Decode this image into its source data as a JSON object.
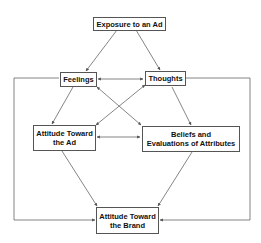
{
  "diagram": {
    "nodes": {
      "exposure": {
        "label": "Exposure to an Ad"
      },
      "feelings": {
        "label": "Feelings"
      },
      "thoughts": {
        "label": "Thoughts"
      },
      "attitude_ad": {
        "line1": "Attitude Toward",
        "line2": "the Ad"
      },
      "beliefs": {
        "line1": "Beliefs and",
        "line2": "Evaluations of Attributes"
      },
      "attitude_brand": {
        "line1": "Attitude Toward",
        "line2": "the Brand"
      }
    },
    "edges": [
      {
        "from": "Exposure to an Ad",
        "to": "Feelings",
        "type": "arrow"
      },
      {
        "from": "Exposure to an Ad",
        "to": "Thoughts",
        "type": "arrow"
      },
      {
        "from": "Feelings",
        "to": "Thoughts",
        "type": "bidirectional"
      },
      {
        "from": "Feelings",
        "to": "Attitude Toward the Ad",
        "type": "arrow"
      },
      {
        "from": "Feelings",
        "to": "Beliefs and Evaluations of Attributes",
        "type": "bidirectional"
      },
      {
        "from": "Thoughts",
        "to": "Attitude Toward the Ad",
        "type": "bidirectional"
      },
      {
        "from": "Thoughts",
        "to": "Beliefs and Evaluations of Attributes",
        "type": "arrow"
      },
      {
        "from": "Attitude Toward the Ad",
        "to": "Beliefs and Evaluations of Attributes",
        "type": "bidirectional"
      },
      {
        "from": "Attitude Toward the Ad",
        "to": "Attitude Toward the Brand",
        "type": "arrow"
      },
      {
        "from": "Beliefs and Evaluations of Attributes",
        "to": "Attitude Toward the Brand",
        "type": "arrow"
      },
      {
        "from": "Feelings",
        "to": "Attitude Toward the Brand",
        "type": "arrow",
        "route": "left-outer"
      },
      {
        "from": "Thoughts",
        "to": "Attitude Toward the Brand",
        "type": "arrow",
        "route": "right-outer"
      }
    ]
  }
}
